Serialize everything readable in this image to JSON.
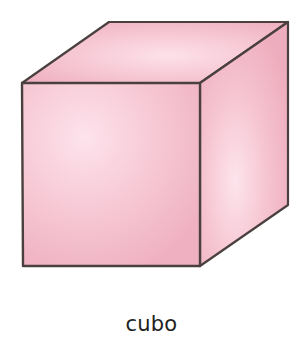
{
  "figure": {
    "shape": "cube",
    "caption": "cubo",
    "colors": {
      "outline": "#4a4040",
      "fill_light": "#fbdde7",
      "fill_mid": "#f4bfcd",
      "fill_dark": "#eeabbd",
      "background": "#ffffff",
      "caption_text": "#231f20"
    },
    "vertices": {
      "front_top_left": [
        22,
        83
      ],
      "front_top_right": [
        200,
        83
      ],
      "front_bottom_left": [
        23,
        266
      ],
      "front_bottom_right": [
        200,
        266
      ],
      "back_top_left": [
        109,
        22
      ],
      "back_top_right": [
        288,
        22
      ],
      "back_bottom_right": [
        288,
        205
      ]
    }
  }
}
